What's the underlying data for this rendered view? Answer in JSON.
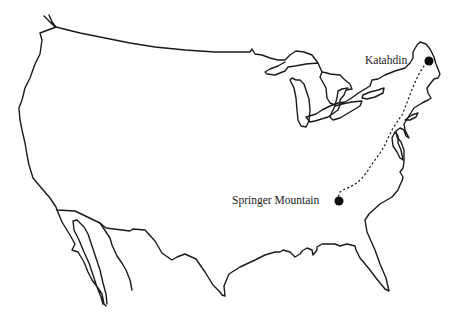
{
  "map": {
    "subject": "Contiguous United States outline with Appalachian Trail route",
    "style": "hand-drawn black outline on white",
    "colors": {
      "background": "#ffffff",
      "ink": "#1a1a1a"
    },
    "points": [
      {
        "id": "katahdin",
        "label": "Katahdin",
        "role": "northern terminus",
        "marker": "filled-circle",
        "x": 429,
        "y": 61
      },
      {
        "id": "springer",
        "label": "Springer Mountain",
        "role": "southern terminus",
        "marker": "filled-circle",
        "x": 339,
        "y": 201
      }
    ],
    "route": {
      "style": "dashed",
      "from": "Springer Mountain",
      "to": "Katahdin"
    }
  }
}
